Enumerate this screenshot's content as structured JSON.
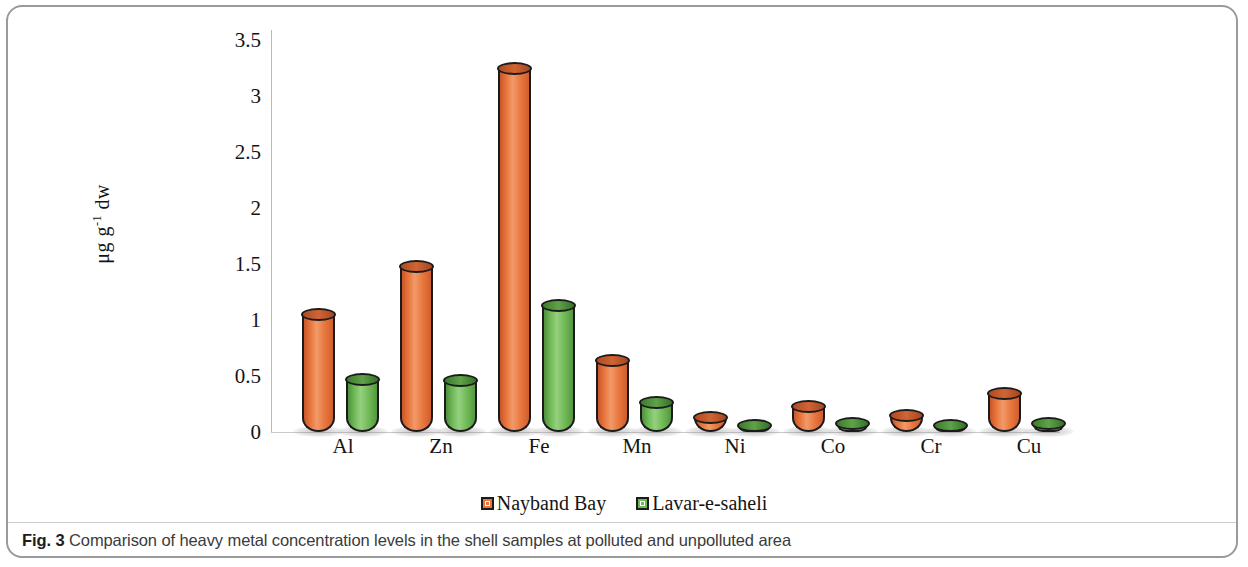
{
  "figure": {
    "caption_label": "Fig. 3",
    "caption_text": "Comparison of heavy metal concentration levels in the shell samples at polluted and unpolluted area"
  },
  "chart_data": {
    "type": "bar",
    "title": "",
    "xlabel": "",
    "ylabel": "μg g⁻¹ dw",
    "ylabel_base": "μg g",
    "ylabel_exponent": "-1",
    "ylabel_suffix": " dw",
    "ylim": [
      0,
      3.5
    ],
    "grid": false,
    "legend_position": "bottom-center",
    "categories": [
      "Al",
      "Zn",
      "Fe",
      "Mn",
      "Ni",
      "Co",
      "Cr",
      "Cu"
    ],
    "ytick_labels": [
      "3.5",
      "3",
      "2.5",
      "2",
      "1.5",
      "1",
      "0.5",
      "0"
    ],
    "ytick_values": [
      3.5,
      3,
      2.5,
      2,
      1.5,
      1,
      0.5,
      0
    ],
    "series": [
      {
        "name": "Nayband Bay",
        "color": "#E8763C",
        "values": [
          1.05,
          1.48,
          3.25,
          0.64,
          0.13,
          0.23,
          0.15,
          0.34
        ]
      },
      {
        "name": "Lavar-e-saheli",
        "color": "#6FBA56",
        "values": [
          0.47,
          0.46,
          1.13,
          0.26,
          0.05,
          0.08,
          0.06,
          0.08
        ]
      }
    ]
  }
}
